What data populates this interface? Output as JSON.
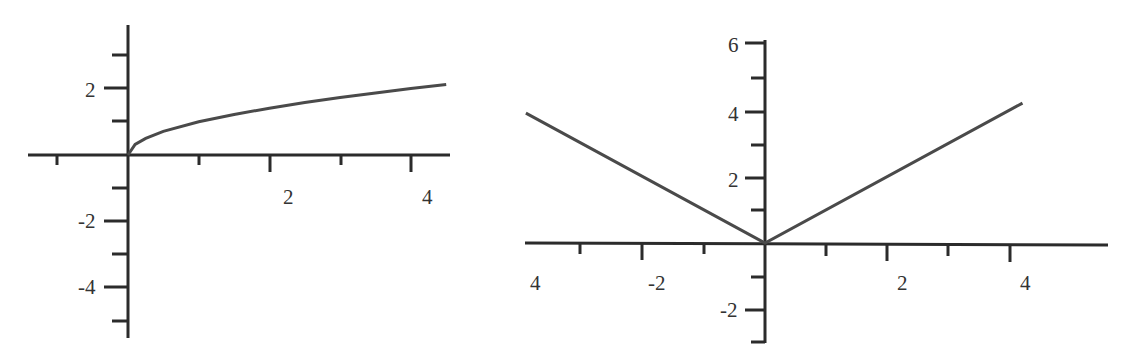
{
  "chart_data": [
    {
      "type": "line",
      "title": "",
      "function": "y = sqrt(x)",
      "xlabel": "",
      "ylabel": "",
      "xlim": [
        -1.0,
        4.5
      ],
      "ylim": [
        -5.2,
        3.8
      ],
      "x_tick_labels": [
        "2",
        "4"
      ],
      "x_tick_values": [
        -1,
        1,
        2,
        3,
        4
      ],
      "y_tick_labels": [
        "2",
        "-2",
        "-4"
      ],
      "y_tick_values": [
        3,
        2,
        1,
        -1,
        -2,
        -3,
        -4,
        -5
      ],
      "grid": false,
      "series": [
        {
          "name": "sqrt(x)",
          "x": [
            0,
            0.1,
            0.25,
            0.5,
            1,
            1.5,
            2,
            2.5,
            3,
            3.5,
            4,
            4.5
          ],
          "y": [
            0,
            0.32,
            0.5,
            0.71,
            1,
            1.22,
            1.41,
            1.58,
            1.73,
            1.87,
            2,
            2.12
          ]
        }
      ]
    },
    {
      "type": "line",
      "title": "",
      "function": "y = |x|",
      "xlabel": "",
      "ylabel": "",
      "xlim": [
        -3.9,
        4.2
      ],
      "ylim": [
        -3,
        6
      ],
      "x_tick_labels": [
        "4",
        "-2",
        "2",
        "4"
      ],
      "x_tick_values": [
        -3,
        -2,
        -1,
        1,
        2,
        3,
        4
      ],
      "y_tick_labels": [
        "6",
        "4",
        "2",
        "-2"
      ],
      "y_tick_values": [
        6,
        5,
        4,
        3,
        2,
        1,
        -1,
        -2,
        -3
      ],
      "grid": false,
      "series": [
        {
          "name": "|x|",
          "x": [
            -3.9,
            0,
            4.2
          ],
          "y": [
            3.9,
            0,
            4.2
          ]
        }
      ]
    }
  ],
  "left": {
    "xlabels": [
      {
        "text": "2",
        "x": 283,
        "y": 204
      },
      {
        "text": "4",
        "x": 422,
        "y": 204
      }
    ],
    "ylabels": [
      {
        "text": "2",
        "x": 85,
        "y": 97
      },
      {
        "text": "-2",
        "x": 78,
        "y": 228
      },
      {
        "text": "-4",
        "x": 78,
        "y": 294
      }
    ]
  },
  "right": {
    "xlabels": [
      {
        "text": "4",
        "x": 530,
        "y": 290
      },
      {
        "text": "-2",
        "x": 648,
        "y": 290
      },
      {
        "text": "2",
        "x": 897,
        "y": 290
      },
      {
        "text": "4",
        "x": 1020,
        "y": 290
      }
    ],
    "ylabels": [
      {
        "text": "6",
        "x": 728,
        "y": 52
      },
      {
        "text": "4",
        "x": 728,
        "y": 121
      },
      {
        "text": "2",
        "x": 728,
        "y": 187
      },
      {
        "text": "-2",
        "x": 720,
        "y": 317
      }
    ]
  }
}
